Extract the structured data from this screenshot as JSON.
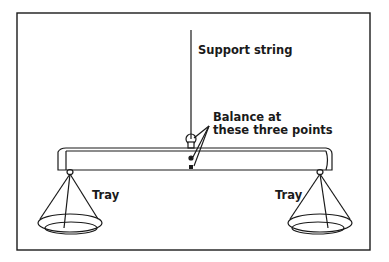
{
  "diagram": {
    "labels": {
      "support_string": "Support string",
      "balance_line1": "Balance at",
      "balance_line2": "these three points",
      "tray_left": "Tray",
      "tray_right": "Tray"
    },
    "colors": {
      "ink": "#1a1a1a",
      "background": "#ffffff"
    }
  }
}
